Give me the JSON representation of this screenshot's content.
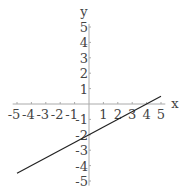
{
  "chart_data": {
    "type": "line",
    "title": "",
    "xlabel": "x",
    "ylabel": "y",
    "xlim": [
      -5,
      5
    ],
    "ylim": [
      -5,
      5
    ],
    "grid": false,
    "x_ticks": [
      "-5",
      "-4",
      "-3",
      "-2",
      "-1",
      "1",
      "2",
      "3",
      "4",
      "5"
    ],
    "y_ticks": [
      "5",
      "4",
      "3",
      "2",
      "1",
      "-1",
      "-2",
      "-3",
      "-4",
      "-5"
    ],
    "series": [
      {
        "name": "y = 0.5x - 2",
        "x": [
          -5,
          5
        ],
        "values": [
          -4.5,
          0.5
        ],
        "color": "#222222"
      }
    ]
  }
}
